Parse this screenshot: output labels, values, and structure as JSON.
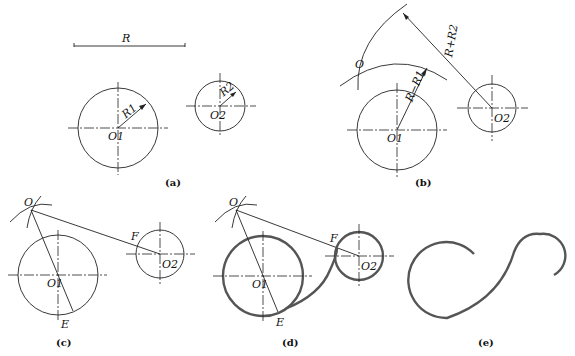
{
  "figure": {
    "panels": [
      {
        "id": "a",
        "caption": "(a)",
        "labels": {
          "radius": "R",
          "center1": "O1",
          "center2": "O2",
          "r1": "R1",
          "r2": "R2"
        }
      },
      {
        "id": "b",
        "caption": "(b)",
        "labels": {
          "center": "O",
          "center1": "O1",
          "center2": "O2",
          "dist1": "R−R1",
          "dist2": "R+R2"
        }
      },
      {
        "id": "c",
        "caption": "(c)",
        "labels": {
          "center": "O",
          "center1": "O1",
          "center2": "O2",
          "point_f": "F",
          "point_e": "E"
        }
      },
      {
        "id": "d",
        "caption": "(d)",
        "labels": {
          "center": "O",
          "center1": "O1",
          "center2": "O2",
          "point_f": "F",
          "point_e": "E"
        }
      },
      {
        "id": "e",
        "caption": "(e)",
        "labels": {}
      }
    ]
  },
  "colors": {
    "line": "#222222",
    "result_curve": "#555555",
    "background": "#ffffff"
  }
}
